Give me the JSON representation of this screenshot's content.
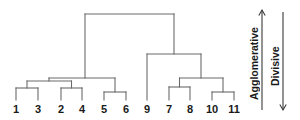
{
  "figure": {
    "background_color": "#ffffff",
    "line_color": "#6b6b6b",
    "text_color": "#1a1a1a",
    "width": 300,
    "height": 120
  },
  "annotations": {
    "agglomerative_label": "Agglomerative",
    "divisive_label": "Divisive",
    "agglomerative_direction": "up",
    "divisive_direction": "down"
  },
  "chart_data": {
    "type": "dendrogram",
    "title": "",
    "xlabel": "",
    "ylabel": "",
    "orientation": "vertical",
    "grid": false,
    "legend": "none",
    "leaf_labels": [
      "1",
      "3",
      "2",
      "4",
      "5",
      "6",
      "9",
      "7",
      "8",
      "10",
      "11"
    ],
    "leaf_x": [
      16,
      38,
      61,
      82,
      104,
      126,
      147,
      169,
      190,
      212,
      234
    ],
    "leaf_baseline_y": 100,
    "merges": [
      {
        "id": "m1",
        "children": [
          "1",
          "3"
        ],
        "x": 27,
        "height_y": 88
      },
      {
        "id": "m2",
        "children": [
          "2",
          "4"
        ],
        "x": 71.5,
        "height_y": 88
      },
      {
        "id": "m3",
        "children": [
          "5",
          "6"
        ],
        "x": 115,
        "height_y": 92
      },
      {
        "id": "m4",
        "children": [
          "m1",
          "m2"
        ],
        "x": 49,
        "height_y": 81
      },
      {
        "id": "m5",
        "children": [
          "m4",
          "m3"
        ],
        "x": 85,
        "height_y": 78
      },
      {
        "id": "m6",
        "children": [
          "7",
          "8"
        ],
        "x": 179.5,
        "height_y": 87
      },
      {
        "id": "m7",
        "children": [
          "10",
          "11"
        ],
        "x": 223,
        "height_y": 92
      },
      {
        "id": "m8",
        "children": [
          "m6",
          "m7"
        ],
        "x": 201,
        "height_y": 78
      },
      {
        "id": "m9",
        "children": [
          "9",
          "m8"
        ],
        "x": 174,
        "height_y": 54
      },
      {
        "id": "root",
        "children": [
          "m5",
          "m9"
        ],
        "x": 133,
        "height_y": 14
      }
    ],
    "axis_arrows": [
      {
        "name": "agglomerative",
        "x": 262,
        "y_from": 110,
        "y_to": 10,
        "direction": "up"
      },
      {
        "name": "divisive",
        "x": 283,
        "y_from": 12,
        "y_to": 110,
        "direction": "down"
      }
    ]
  }
}
